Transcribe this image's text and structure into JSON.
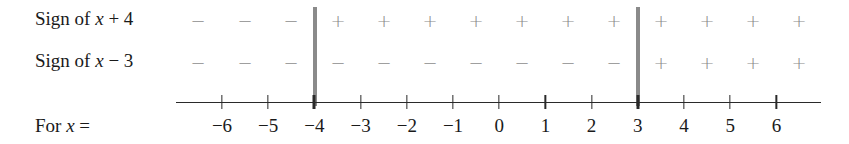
{
  "rows": [
    {
      "label_prefix": "Sign of ",
      "var": "x",
      "label_suffix": " + 4",
      "signs": [
        "−",
        "−",
        "−",
        "+",
        "+",
        "+",
        "+",
        "+",
        "+",
        "+",
        "+",
        "+",
        "+",
        "+"
      ]
    },
    {
      "label_prefix": "Sign of ",
      "var": "x",
      "label_suffix": " − 3",
      "signs": [
        "−",
        "−",
        "−",
        "−",
        "−",
        "−",
        "−",
        "−",
        "−",
        "−",
        "+",
        "+",
        "+",
        "+"
      ]
    }
  ],
  "axis": {
    "label_prefix": "For ",
    "var": "x",
    "label_suffix": " =",
    "ticks": [
      "−6",
      "−5",
      "−4",
      "−3",
      "−2",
      "−1",
      "0",
      "1",
      "2",
      "3",
      "4",
      "5",
      "6"
    ],
    "critical_points": [
      "−4",
      "3"
    ]
  },
  "chart_data": {
    "type": "sign-chart",
    "title": "",
    "factors": [
      "x + 4",
      "x − 3"
    ],
    "x_ticks": [
      -6,
      -5,
      -4,
      -3,
      -2,
      -1,
      0,
      1,
      2,
      3,
      4,
      5,
      6
    ],
    "critical_points": [
      -4,
      3
    ],
    "intervals": [
      {
        "range": "x < -4",
        "x+4": "−",
        "x-3": "−"
      },
      {
        "range": "-4 < x < 3",
        "x+4": "+",
        "x-3": "−"
      },
      {
        "range": "x > 3",
        "x+4": "+",
        "x-3": "+"
      }
    ]
  }
}
